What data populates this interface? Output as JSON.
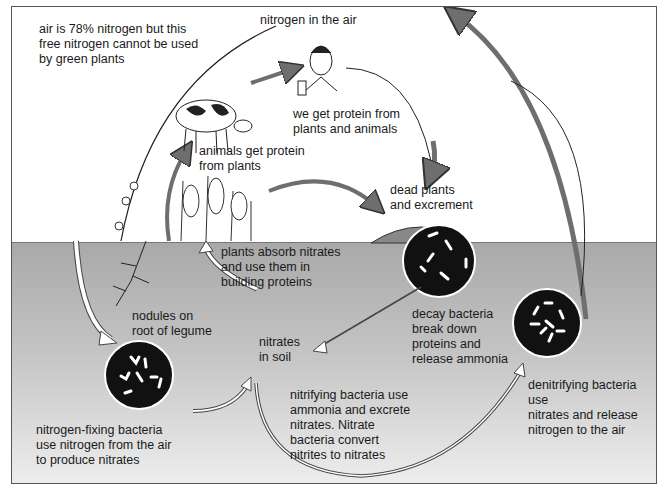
{
  "diagram": {
    "title": "nitrogen in the air",
    "labels": {
      "air_note": "air is 78% nitrogen but this\nfree nitrogen cannot be used\nby green plants",
      "humans": "we get protein from\nplants and animals",
      "animals": "animals get protein\nfrom plants",
      "dead_matter": "dead plants\nand excrement",
      "plants_absorb": "plants absorb nitrates\nand use them in\nbuilding proteins",
      "nodules": "nodules on\nroot of legume",
      "nitrates_soil": "nitrates\nin soil",
      "decay": "decay bacteria\nbreak down\nproteins and\nrelease ammonia",
      "denitrifying": "denitrifying bacteria use\nnitrates and release\nnitrogen to the air",
      "nitrogen_fixing": "nitrogen-fixing bacteria\nuse nitrogen from the air\nto produce nitrates",
      "nitrifying": "nitrifying bacteria use\nammonia and excrete\nnitrates. Nitrate\nbacteria convert\nnitrites to nitrates"
    },
    "colors": {
      "arrow_dark": "#6e6e6e",
      "soil_top": "#a9a9a9",
      "soil_bottom": "#eeeeee",
      "bacteria_disc": "#111111"
    }
  }
}
